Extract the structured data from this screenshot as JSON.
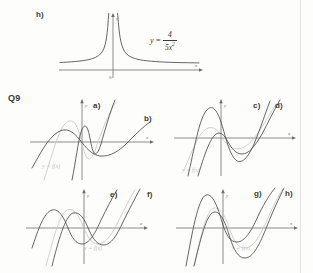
{
  "page": {
    "background": "#fdfdfc",
    "ink": "#4a4a4a",
    "ghost_ink": "#c9c9c9",
    "axis_color": "#6e6e6e"
  },
  "top_figure": {
    "part_label": "h)",
    "equation": {
      "lhs": "y =",
      "numerator": "4",
      "denominator_coef": "5x",
      "denominator_exp": "2",
      "plain": "y = 4/(5x^2)"
    },
    "axes": {
      "x_label": "x",
      "y_label": "y",
      "origin_label": "0"
    }
  },
  "question": {
    "number": "Q9"
  },
  "panels": [
    {
      "id": "panel-ab",
      "curve_labels": [
        "a)",
        "b)"
      ],
      "reference_label": "y = f(x)",
      "axes": {
        "x_label": "x",
        "y_label": "y"
      }
    },
    {
      "id": "panel-cd",
      "curve_labels": [
        "c)",
        "d)"
      ],
      "reference_label": "y = f(x)",
      "axes": {
        "x_label": "x",
        "y_label": "y"
      }
    },
    {
      "id": "panel-ef",
      "curve_labels": [
        "e)",
        "f)"
      ],
      "reference_label": "y = f(x)",
      "axes": {
        "x_label": "x",
        "y_label": "y"
      }
    },
    {
      "id": "panel-gh",
      "curve_labels": [
        "g)",
        "h)"
      ],
      "reference_label": "y = f(x)",
      "axes": {
        "x_label": "x",
        "y_label": "y"
      }
    }
  ]
}
